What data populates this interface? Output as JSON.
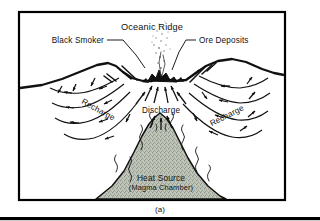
{
  "figure": {
    "caption": "(a)",
    "title": "Oceanic Ridge",
    "frame_color": "#000000",
    "background_color": "#ffffff",
    "line_color": "#111111",
    "magma_fill_color": "#b9bfb2",
    "magma_outline_color": "#111111"
  },
  "labels": {
    "title": "Oceanic Ridge",
    "black_smoker": "Black Smoker",
    "ore_deposits": "Ore Deposits",
    "recharge_left": "Recharge",
    "recharge_right": "Recharge",
    "discharge": "Discharge",
    "heat_source": "Heat Source",
    "magma_chamber": "(Magma Chamber)"
  },
  "diagram": {
    "type": "cross-section-schematic",
    "elements": [
      "seafloor-profile",
      "axial-valley",
      "normal-fault-ticks",
      "black-smoker-vent",
      "smoke-plume",
      "ore-deposit-mounds",
      "discharge-arrows",
      "recharge-flow-arcs",
      "magma-chamber",
      "heat-squiggles"
    ],
    "flow": {
      "recharge_direction": "downward and inward from ridge flanks",
      "discharge_direction": "upward along ridge axis"
    }
  }
}
